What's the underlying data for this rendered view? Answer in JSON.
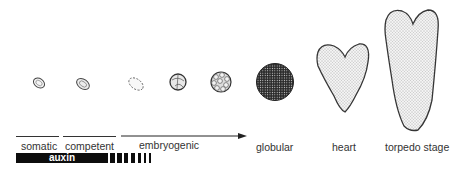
{
  "figure": {
    "stages": [
      {
        "name": "somatic",
        "label": "somatic"
      },
      {
        "name": "competent",
        "label": "competent"
      },
      {
        "name": "embryogenic",
        "label": "embryogenic"
      },
      {
        "name": "globular",
        "label": "globular"
      },
      {
        "name": "heart",
        "label": "heart"
      },
      {
        "name": "torpedo",
        "label": "torpedo stage"
      }
    ],
    "treatment_bar": {
      "label": "auxin"
    },
    "colors": {
      "ink": "#222222",
      "bar": "#0d0d0d",
      "stipple": "#555555",
      "background": "#ffffff"
    }
  }
}
